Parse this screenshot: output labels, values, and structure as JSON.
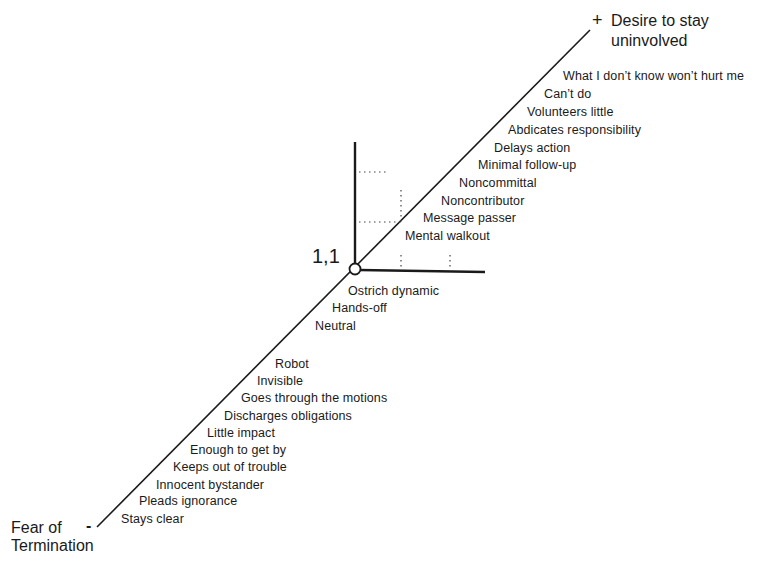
{
  "diagram": {
    "top_pole": {
      "sign": "+",
      "line1": "Desire to stay",
      "line2": "uninvolved"
    },
    "bottom_pole": {
      "sign": "-",
      "line1": "Fear of",
      "line2": "Termination"
    },
    "origin_label": "1,1",
    "upper_items": [
      "What I don’t know won’t hurt me",
      "Can’t do",
      "Volunteers little",
      "Abdicates responsibility",
      "Delays action",
      "Minimal follow-up",
      "Noncommittal",
      "Noncontributor",
      "Message passer",
      "Mental walkout"
    ],
    "middle_items": [
      "Ostrich dynamic",
      "Hands-off",
      "Neutral"
    ],
    "lower_items": [
      "Robot",
      "Invisible",
      "Goes through the motions",
      "Discharges obligations",
      "Little impact",
      "Enough to get by",
      "Keeps out of trouble",
      "Innocent bystander",
      "Pleads ignorance",
      "Stays clear"
    ]
  }
}
